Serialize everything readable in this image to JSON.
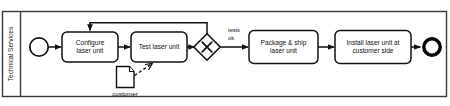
{
  "diagram": {
    "type": "bpmn-process",
    "background_color": "#ffffff",
    "line_color": "#111111",
    "pool": {
      "lane_label": "Technical Services"
    },
    "events": {
      "start": {
        "name": "start-event",
        "label": ""
      },
      "end": {
        "name": "end-event",
        "label": ""
      }
    },
    "tasks": [
      {
        "id": "configure",
        "lines": [
          "Configure",
          "laser unit"
        ]
      },
      {
        "id": "test",
        "lines": [
          "Test laser unit"
        ]
      },
      {
        "id": "package",
        "lines": [
          "Package & ship",
          "laser unit"
        ]
      },
      {
        "id": "install",
        "lines": [
          "Install laser unit at",
          "customer side"
        ]
      }
    ],
    "gateway": {
      "id": "tests-gateway",
      "kind": "exclusive",
      "marker": "X"
    },
    "flow_labels": [
      {
        "id": "tests-ok",
        "lines": [
          "tests",
          "ok"
        ]
      }
    ],
    "data_objects": [
      {
        "id": "customer",
        "label": "customer"
      }
    ]
  }
}
